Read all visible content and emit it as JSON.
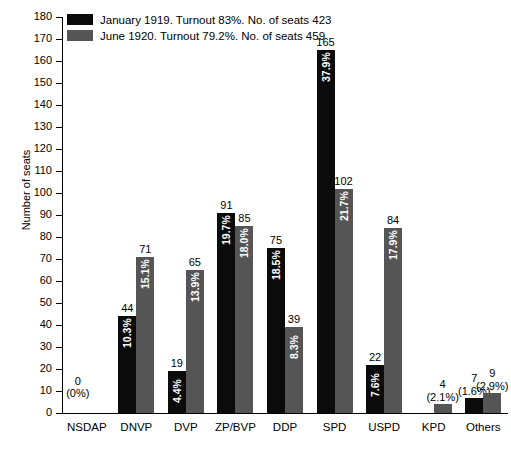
{
  "chart_data": {
    "type": "bar",
    "title": "",
    "xlabel": "",
    "ylabel": "Number of seats",
    "ylim": [
      0,
      180
    ],
    "ytick_step": 10,
    "grid": false,
    "legend_position": "top-left",
    "categories": [
      "NSDAP",
      "DNVP",
      "DVP",
      "ZP/BVP",
      "DDP",
      "SPD",
      "USPD",
      "KPD",
      "Others"
    ],
    "yticks": [
      "0",
      "10",
      "20",
      "30",
      "40",
      "50",
      "60",
      "70",
      "80",
      "90",
      "100",
      "110",
      "120",
      "130",
      "140",
      "150",
      "160",
      "170",
      "180"
    ],
    "series": [
      {
        "name": "January 1919. Turnout 83%. No. of seats 423",
        "color": "#0b0b0b",
        "values": [
          0,
          44,
          19,
          91,
          75,
          165,
          22,
          null,
          7
        ],
        "percent_labels": [
          "(0%)",
          "10.3%",
          "4.4%",
          "19.7%",
          "18.5%",
          "37.9%",
          "7.6%",
          null,
          "(1.6%)"
        ],
        "value_labels": [
          "0",
          "44",
          "19",
          "91",
          "75",
          "165",
          "22",
          null,
          "7"
        ]
      },
      {
        "name": "June 1920. Turnout 79.2%. No. of seats 459",
        "color": "#555555",
        "values": [
          null,
          71,
          65,
          85,
          39,
          102,
          84,
          4,
          9
        ],
        "percent_labels": [
          null,
          "15.1%",
          "13.9%",
          "18.0%",
          "8.3%",
          "21.7%",
          "17.9%",
          "(2.1%)",
          "(2.9%)"
        ],
        "value_labels": [
          null,
          "71",
          "65",
          "85",
          "39",
          "102",
          "84",
          "4",
          "9"
        ]
      }
    ]
  },
  "legend": {
    "items": [
      {
        "label": "January 1919. Turnout 83%. No. of seats 423",
        "color": "#0b0b0b"
      },
      {
        "label": "June 1920. Turnout 79.2%. No. of seats 459",
        "color": "#555555"
      }
    ]
  },
  "axis": {
    "y_title": "Number of seats"
  }
}
